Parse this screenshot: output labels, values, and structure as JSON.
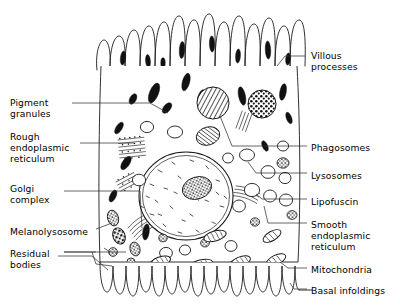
{
  "diagram": {
    "style": "black-and-white line drawing",
    "ink_color": "#111111",
    "background_color": "#ffffff"
  },
  "labels_left": [
    {
      "id": "pigment-granules",
      "text": "Pigment\ngranules",
      "x": 10,
      "y": 97
    },
    {
      "id": "rough-endoplasmic-reticulum",
      "text": "Rough\nendoplasmic\nreticulum",
      "x": 10,
      "y": 131
    },
    {
      "id": "golgi-complex",
      "text": "Golgi\ncomplex",
      "x": 10,
      "y": 183
    },
    {
      "id": "melanolysosome",
      "text": "Melanolysosome",
      "x": 10,
      "y": 226
    },
    {
      "id": "residual-bodies",
      "text": "Residual\nbodies",
      "x": 10,
      "y": 248
    }
  ],
  "labels_right": [
    {
      "id": "villous-processes",
      "text": "Villous\nprocesses",
      "x": 311,
      "y": 50
    },
    {
      "id": "phagosomes",
      "text": "Phagosomes",
      "x": 311,
      "y": 142
    },
    {
      "id": "lysosomes",
      "text": "Lysosomes",
      "x": 311,
      "y": 170
    },
    {
      "id": "lipofuscin",
      "text": "Lipofuscin",
      "x": 311,
      "y": 196
    },
    {
      "id": "smooth-endoplasmic-reticulum",
      "text": "Smooth\nendoplasmic\nreticulum",
      "x": 311,
      "y": 219
    },
    {
      "id": "mitochondria",
      "text": "Mitochondria",
      "x": 311,
      "y": 264
    },
    {
      "id": "basal-infoldings",
      "text": "Basal infoldings",
      "x": 311,
      "y": 285
    }
  ],
  "structures": [
    {
      "name": "apical-villi",
      "description": "finger-like villous processes along the top of the cell"
    },
    {
      "name": "nucleus",
      "description": "large round nucleus with chromatin stipple"
    },
    {
      "name": "nucleolus",
      "description": "dark speckled body inside the nucleus"
    },
    {
      "name": "phagosome-hatched",
      "description": "large circular phagosome with hatched fill"
    },
    {
      "name": "phagosome-speckled",
      "description": "large circular phagosome with dark speckled fill"
    },
    {
      "name": "basal-infoldings",
      "description": "row of U-shaped infoldings along the cell base"
    }
  ]
}
